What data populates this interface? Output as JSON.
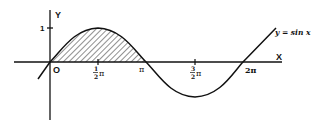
{
  "figure": {
    "curve_label": "y = sin x",
    "axis_labels": {
      "x": "X",
      "y": "Y"
    },
    "origin_label": "O",
    "y_tick": "1",
    "x_ticks": [
      {
        "num": "1",
        "den": "2",
        "sym": "π",
        "value": "1/2 π"
      },
      {
        "num": "",
        "den": "",
        "sym": "π",
        "value": "π"
      },
      {
        "num": "3",
        "den": "2",
        "sym": "π",
        "value": "3/2 π"
      },
      {
        "num": "",
        "den": "",
        "sym": "2π",
        "value": "2π"
      }
    ],
    "shaded_region": "0 ≤ x ≤ π under y = sin x",
    "colors": {
      "ink": "#111111",
      "background": "#ffffff"
    }
  }
}
